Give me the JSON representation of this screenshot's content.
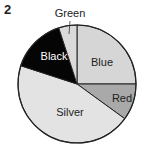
{
  "figure": {
    "number": "2"
  },
  "chart_data": {
    "type": "pie",
    "title": "",
    "start_angle_deg": 0,
    "direction": "clockwise",
    "center": [
      77,
      84
    ],
    "radius": 59,
    "slices": [
      {
        "label": "Blue",
        "value": 25,
        "color": "#d6d6d6",
        "label_pos": [
          102,
          66
        ],
        "label_color": "#222222"
      },
      {
        "label": "Red",
        "value": 10,
        "color": "#a9a9a9",
        "label_pos": [
          122,
          102
        ],
        "label_color": "#222222"
      },
      {
        "label": "Silver",
        "value": 45,
        "color": "#e3e3e3",
        "label_pos": [
          70,
          116
        ],
        "label_color": "#222222"
      },
      {
        "label": "Black",
        "value": 15,
        "color": "#050505",
        "label_pos": [
          54,
          60
        ],
        "label_color": "#ffffff"
      },
      {
        "label": "Green",
        "value": 5,
        "color": "#dadada",
        "label_pos": [
          70,
          17
        ],
        "label_color": "#222222",
        "leader": [
          [
            70,
            21
          ],
          [
            69,
            34
          ]
        ]
      }
    ]
  }
}
